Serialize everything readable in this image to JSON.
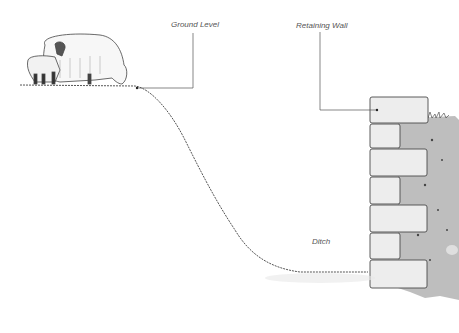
{
  "diagram": {
    "labels": {
      "ground_level": "Ground Level",
      "retaining_wall": "Retaining Wall",
      "ditch": "Ditch"
    },
    "colors": {
      "background": "#ffffff",
      "line": "#555555",
      "stone_fill": "#ececec",
      "soil_fill": "#9a9a9a",
      "label_text": "#555555"
    },
    "elements": [
      {
        "name": "sheep",
        "description": "ewe and lamb grazing on upper ground"
      },
      {
        "name": "slope",
        "description": "grassy bank descending from ground level into ditch"
      },
      {
        "name": "ditch",
        "description": "flat grassy bottom"
      },
      {
        "name": "retaining-wall",
        "description": "stacked stone blocks with soil behind"
      }
    ]
  }
}
